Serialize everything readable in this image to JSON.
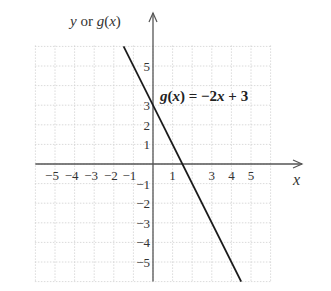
{
  "chart_data": {
    "type": "line",
    "title": "",
    "xlabel": "x",
    "ylabel": "y or g(x)",
    "xlim": [
      -6,
      6
    ],
    "ylim": [
      -6,
      6
    ],
    "grid": true,
    "x_ticks": [
      -5,
      -4,
      -3,
      -2,
      -1,
      1,
      3,
      4,
      5
    ],
    "y_ticks": [
      5,
      3,
      2,
      1,
      -1,
      -2,
      -3,
      -4,
      -5
    ],
    "series": [
      {
        "name": "g(x) = -2x + 3",
        "slope": -2,
        "intercept": 3,
        "x": [
          -1.5,
          4.5
        ],
        "y": [
          6,
          -6
        ]
      }
    ],
    "annotations": [
      {
        "text": "g(x) = −2x + 3",
        "x": 0.3,
        "y": 3.6
      }
    ]
  },
  "labels": {
    "y_axis": "y or g(x)",
    "x_axis": "x",
    "equation": "g(x) = −2x + 3"
  },
  "colors": {
    "line": "#1a1a1a",
    "axis": "#555555",
    "grid": "#d0d0d0"
  }
}
